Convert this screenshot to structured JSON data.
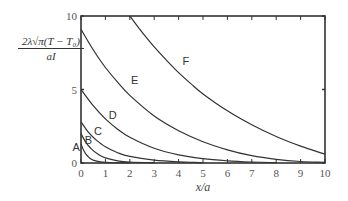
{
  "chart_data": {
    "type": "line",
    "title": "",
    "xlabel": "x/a",
    "ylabel": {
      "numerator": "2λ√π(T − T₀)",
      "denominator": "aI"
    },
    "xlim": [
      0,
      10
    ],
    "ylim": [
      0,
      10
    ],
    "x_ticks": [
      "0",
      "1",
      "2",
      "3",
      "4",
      "5",
      "6",
      "7",
      "8",
      "9",
      "10"
    ],
    "y_ticks": [
      "0",
      "5",
      "10"
    ],
    "grid": false,
    "legend": "inline curve labels",
    "series": [
      {
        "name": "A",
        "points": [
          [
            0,
            1.3
          ],
          [
            0.1,
            0.9
          ],
          [
            0.2,
            0.6
          ],
          [
            0.35,
            0.35
          ],
          [
            0.5,
            0.2
          ],
          [
            0.8,
            0.08
          ],
          [
            1.2,
            0.03
          ],
          [
            2,
            0.01
          ]
        ]
      },
      {
        "name": "B",
        "points": [
          [
            0,
            2.0
          ],
          [
            0.2,
            1.4
          ],
          [
            0.4,
            1.0
          ],
          [
            0.7,
            0.6
          ],
          [
            1,
            0.35
          ],
          [
            1.5,
            0.15
          ],
          [
            2,
            0.07
          ],
          [
            3,
            0.02
          ]
        ]
      },
      {
        "name": "C",
        "points": [
          [
            0,
            2.8
          ],
          [
            0.3,
            2.1
          ],
          [
            0.6,
            1.6
          ],
          [
            1,
            1.1
          ],
          [
            1.5,
            0.7
          ],
          [
            2,
            0.45
          ],
          [
            3,
            0.2
          ],
          [
            4,
            0.08
          ],
          [
            5,
            0.03
          ]
        ]
      },
      {
        "name": "D",
        "points": [
          [
            0,
            5.0
          ],
          [
            0.5,
            3.9
          ],
          [
            1,
            3.0
          ],
          [
            1.5,
            2.3
          ],
          [
            2,
            1.75
          ],
          [
            3,
            1.0
          ],
          [
            4,
            0.55
          ],
          [
            5,
            0.3
          ],
          [
            6,
            0.15
          ],
          [
            7,
            0.07
          ],
          [
            8,
            0.03
          ]
        ]
      },
      {
        "name": "E",
        "points": [
          [
            0,
            9.1
          ],
          [
            0.5,
            7.7
          ],
          [
            1,
            6.5
          ],
          [
            1.5,
            5.5
          ],
          [
            2,
            4.6
          ],
          [
            3,
            3.2
          ],
          [
            4,
            2.2
          ],
          [
            5,
            1.45
          ],
          [
            6,
            0.9
          ],
          [
            7,
            0.5
          ],
          [
            8,
            0.25
          ],
          [
            9,
            0.1
          ],
          [
            10,
            0.05
          ]
        ]
      },
      {
        "name": "F",
        "points": [
          [
            2,
            10
          ],
          [
            2.5,
            8.9
          ],
          [
            3,
            7.9
          ],
          [
            3.5,
            7.0
          ],
          [
            4,
            6.15
          ],
          [
            4.5,
            5.4
          ],
          [
            5,
            4.7
          ],
          [
            6,
            3.55
          ],
          [
            7,
            2.6
          ],
          [
            8,
            1.8
          ],
          [
            9,
            1.15
          ],
          [
            10,
            0.6
          ]
        ]
      }
    ],
    "labels": [
      {
        "text": "A",
        "x": -0.2,
        "y": 0.8
      },
      {
        "text": "B",
        "x": 0.3,
        "y": 1.3
      },
      {
        "text": "C",
        "x": 0.7,
        "y": 1.9
      },
      {
        "text": "D",
        "x": 1.3,
        "y": 3.0
      },
      {
        "text": "E",
        "x": 2.2,
        "y": 5.4
      },
      {
        "text": "F",
        "x": 4.3,
        "y": 6.7
      }
    ]
  }
}
